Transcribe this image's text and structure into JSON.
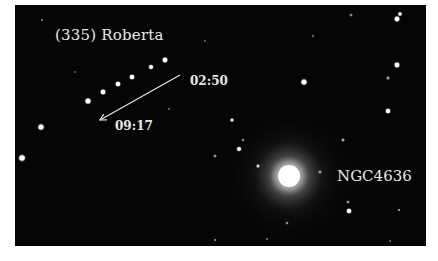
{
  "image": {
    "subject": "Asteroid trail near galaxy",
    "background_color": "#050505",
    "label_color": "#e8e8e8"
  },
  "labels": {
    "asteroid": "(335) Roberta",
    "galaxy": "NGC4636",
    "time_start": "02:50",
    "time_end": "09:17"
  },
  "asteroid_trail": {
    "direction": "from 02:50 (upper right) toward 09:17 (lower left)",
    "positions": [
      {
        "x": 150,
        "y": 55,
        "r": 2.4
      },
      {
        "x": 136,
        "y": 62,
        "r": 2.1
      },
      {
        "x": 117,
        "y": 72,
        "r": 2.3
      },
      {
        "x": 103,
        "y": 79,
        "r": 2.3
      },
      {
        "x": 88,
        "y": 87,
        "r": 2.4
      },
      {
        "x": 73,
        "y": 96,
        "r": 2.6
      }
    ]
  },
  "arrow": {
    "x1": 165,
    "y1": 70,
    "x2": 85,
    "y2": 115
  },
  "galaxy": {
    "cx": 274,
    "cy": 171,
    "core_r": 11,
    "halo_r": 38
  },
  "stars": [
    {
      "x": 26,
      "y": 122,
      "r": 2.6,
      "b": 1.0
    },
    {
      "x": 7,
      "y": 153,
      "r": 2.8,
      "b": 1.0
    },
    {
      "x": 385,
      "y": 9,
      "r": 1.8,
      "b": 0.9
    },
    {
      "x": 382,
      "y": 14,
      "r": 2.4,
      "b": 1.0
    },
    {
      "x": 382,
      "y": 60,
      "r": 2.4,
      "b": 1.0
    },
    {
      "x": 373,
      "y": 73,
      "r": 1.5,
      "b": 0.5
    },
    {
      "x": 373,
      "y": 106,
      "r": 2.2,
      "b": 1.0
    },
    {
      "x": 289,
      "y": 77,
      "r": 2.6,
      "b": 1.0
    },
    {
      "x": 336,
      "y": 10,
      "r": 1.3,
      "b": 0.45
    },
    {
      "x": 298,
      "y": 31,
      "r": 1.2,
      "b": 0.3
    },
    {
      "x": 217,
      "y": 115,
      "r": 1.6,
      "b": 0.85
    },
    {
      "x": 224,
      "y": 144,
      "r": 2.0,
      "b": 0.95
    },
    {
      "x": 200,
      "y": 151,
      "r": 1.3,
      "b": 0.5
    },
    {
      "x": 243,
      "y": 161,
      "r": 1.5,
      "b": 0.75
    },
    {
      "x": 305,
      "y": 167,
      "r": 1.5,
      "b": 0.45
    },
    {
      "x": 228,
      "y": 135,
      "r": 1.2,
      "b": 0.45
    },
    {
      "x": 328,
      "y": 135,
      "r": 1.4,
      "b": 0.55
    },
    {
      "x": 333,
      "y": 197,
      "r": 1.3,
      "b": 0.5
    },
    {
      "x": 334,
      "y": 206,
      "r": 2.2,
      "b": 1.0
    },
    {
      "x": 384,
      "y": 205,
      "r": 1.1,
      "b": 0.55
    },
    {
      "x": 272,
      "y": 218,
      "r": 1.2,
      "b": 0.45
    },
    {
      "x": 252,
      "y": 234,
      "r": 1.1,
      "b": 0.35
    },
    {
      "x": 27,
      "y": 15,
      "r": 1.1,
      "b": 0.4
    },
    {
      "x": 60,
      "y": 67,
      "r": 1.0,
      "b": 0.3
    },
    {
      "x": 154,
      "y": 104,
      "r": 1.0,
      "b": 0.35
    },
    {
      "x": 200,
      "y": 235,
      "r": 1.0,
      "b": 0.5
    },
    {
      "x": 375,
      "y": 236,
      "r": 1.0,
      "b": 0.35
    },
    {
      "x": 190,
      "y": 36,
      "r": 1.0,
      "b": 0.3
    }
  ]
}
